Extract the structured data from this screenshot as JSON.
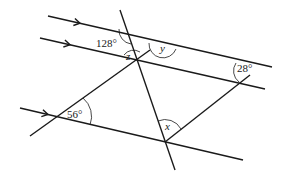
{
  "diagram": {
    "parallel_lines": [
      {
        "id": "line-1",
        "x1": 48,
        "y1": 16,
        "x2": 272,
        "y2": 67,
        "has_arrow": true,
        "arrow_x": 80
      },
      {
        "id": "line-2",
        "x1": 40,
        "y1": 38,
        "x2": 265,
        "y2": 89,
        "has_arrow": true,
        "arrow_x": 70
      },
      {
        "id": "line-3",
        "x1": 20,
        "y1": 108,
        "x2": 243,
        "y2": 160,
        "has_arrow": true,
        "arrow_x": 48
      }
    ],
    "transversals": [
      {
        "id": "steep-transversal",
        "x1": 120,
        "y1": 10,
        "x2": 175,
        "y2": 170
      },
      {
        "id": "diagonal-left",
        "x1": 30,
        "y1": 136,
        "x2": 150,
        "y2": 50
      },
      {
        "id": "diagonal-right",
        "x1": 165,
        "y1": 142,
        "x2": 250,
        "y2": 75
      }
    ],
    "angle_labels": [
      {
        "id": "angle-128",
        "text": "128°",
        "x": 96,
        "y": 47,
        "italic": false
      },
      {
        "id": "angle-z",
        "text": "z",
        "x": 126,
        "y": 60,
        "italic": true
      },
      {
        "id": "angle-y",
        "text": "y",
        "x": 160,
        "y": 52,
        "italic": true
      },
      {
        "id": "angle-28",
        "text": "28°",
        "x": 237,
        "y": 72,
        "italic": false
      },
      {
        "id": "angle-56",
        "text": "56°",
        "x": 67,
        "y": 118,
        "italic": false
      },
      {
        "id": "angle-x",
        "text": "x",
        "x": 165,
        "y": 130,
        "italic": true
      }
    ]
  }
}
